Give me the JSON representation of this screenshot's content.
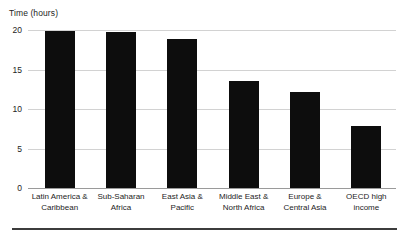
{
  "chart_data": {
    "type": "bar",
    "title": "",
    "xlabel": "",
    "ylabel": "Time (hours)",
    "ylim": [
      0,
      20
    ],
    "yticks": [
      0,
      5,
      10,
      15,
      20
    ],
    "ytick_labels": [
      "0",
      "5",
      "10",
      "15",
      "20"
    ],
    "grid": true,
    "legend": "none",
    "bar_color": "#0d0d0d",
    "gridline_color": "#d2d2d2",
    "axis_color": "#9a9a9a",
    "categories": [
      "Latin America & Caribbean",
      "Sub-Saharan Africa",
      "East Asia & Pacific",
      "Middle East & North Africa",
      "Europe & Central Asia",
      "OECD high income"
    ],
    "category_lines": [
      [
        "Latin America &",
        "Caribbean"
      ],
      [
        "Sub-Saharan",
        "Africa"
      ],
      [
        "East Asia &",
        "Pacific"
      ],
      [
        "Middle East &",
        "North Africa"
      ],
      [
        "Europe &",
        "Central Asia"
      ],
      [
        "OECD high",
        "income"
      ]
    ],
    "values": [
      19.9,
      19.8,
      18.9,
      13.6,
      12.1,
      7.9
    ]
  },
  "footer": {
    "rule_color": "#3c3c3c"
  }
}
